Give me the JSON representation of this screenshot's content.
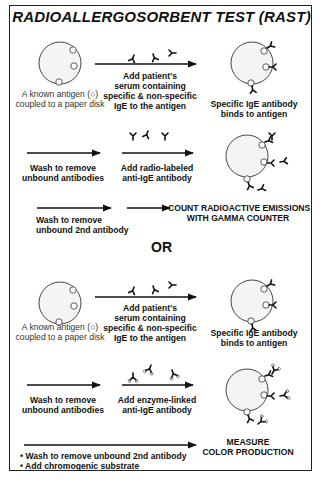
{
  "title": "RADIOALLERGOSORBENT TEST (RAST)",
  "divider_label": "OR",
  "colors": {
    "disk_fill": "#f4f4f4",
    "outline": "#333333",
    "text": "#111111"
  },
  "method_radio": {
    "step1": {
      "disk_caption_1": "A known antigen (○)",
      "disk_caption_2": "coupled to a paper disk",
      "arrow_label_1": "Add patient's",
      "arrow_label_2": "serum containing",
      "arrow_label_3": "specific & non-specific",
      "arrow_label_4": "IgE to the antigen",
      "result_1": "Specific IgE antibody",
      "result_2": "binds to antigen"
    },
    "step2": {
      "wash_1": "Wash to remove",
      "wash_2": "unbound antibodies",
      "add_1": "Add radio-labeled",
      "add_2": "anti-IgE antibody"
    },
    "step3": {
      "wash_1": "Wash to remove",
      "wash_2": "unbound 2nd antibody",
      "result_1": "COUNT RADIOACTIVE EMISSIONS",
      "result_2": "WITH GAMMA COUNTER"
    }
  },
  "method_enzyme": {
    "step1": {
      "disk_caption_1": "A known antigen (○)",
      "disk_caption_2": "coupled to a paper disk",
      "arrow_label_1": "Add patient's",
      "arrow_label_2": "serum containing",
      "arrow_label_3": "specific & non-specific",
      "arrow_label_4": "IgE to the antigen",
      "result_1": "Specific IgE antibody",
      "result_2": "binds to antigen"
    },
    "step2": {
      "wash_1": "Wash to remove",
      "wash_2": "unbound antibodies",
      "add_1": "Add enzyme-linked",
      "add_2": "anti-IgE antibody"
    },
    "step3": {
      "bullet_1": "• Wash to remove unbound 2nd antibody",
      "bullet_2": "• Add chromogenic substrate",
      "result_1": "MEASURE",
      "result_2": "COLOR PRODUCTION"
    }
  }
}
